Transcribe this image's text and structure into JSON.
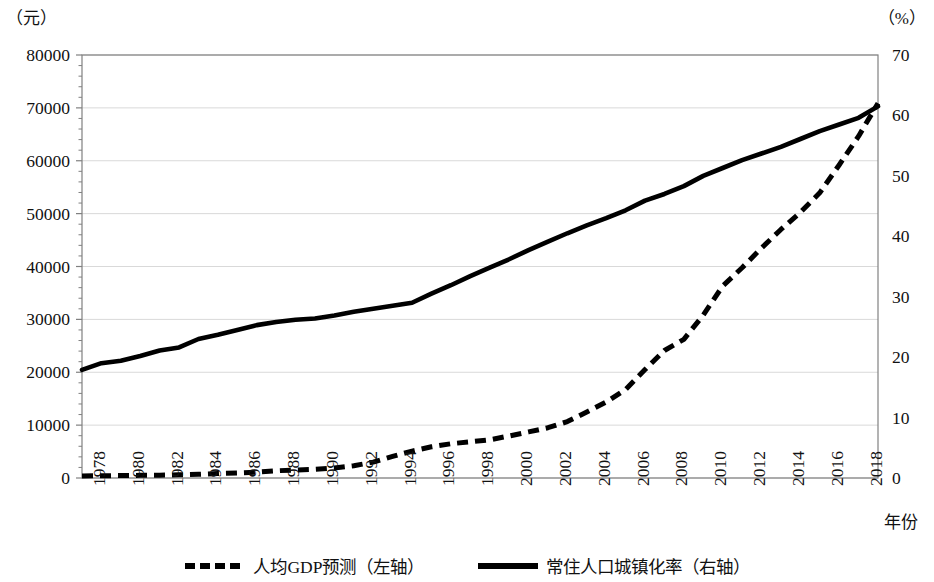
{
  "axes": {
    "left_unit": "（元）",
    "right_unit": "（%）",
    "x_title": "年份",
    "y_left_ticks": [
      "0",
      "10000",
      "20000",
      "30000",
      "40000",
      "50000",
      "60000",
      "70000",
      "80000"
    ],
    "y_right_ticks": [
      "0",
      "10",
      "20",
      "30",
      "40",
      "50",
      "60",
      "70"
    ],
    "x_ticks": [
      "1978",
      "1980",
      "1982",
      "1984",
      "1986",
      "1988",
      "1990",
      "1992",
      "1994",
      "1996",
      "1998",
      "2000",
      "2002",
      "2004",
      "2006",
      "2008",
      "2010",
      "2012",
      "2014",
      "2016",
      "2018"
    ]
  },
  "legend": {
    "items": [
      {
        "label": "人均GDP预测（左轴）",
        "style": "dashed"
      },
      {
        "label": "常住人口城镇化率（右轴）",
        "style": "solid"
      }
    ]
  },
  "colors": {
    "line": "#000000",
    "gridline": "#d9d9d9",
    "frame": "#808080",
    "background": "#ffffff"
  },
  "chart_data": {
    "type": "line",
    "title": "",
    "xlabel": "年份",
    "ylabel": "（元）",
    "y2label": "（%）",
    "grid": true,
    "legend_position": "bottom",
    "xlim": [
      1978,
      2019
    ],
    "ylim": [
      0,
      80000
    ],
    "y2lim": [
      0,
      70
    ],
    "x": [
      1978,
      1979,
      1980,
      1981,
      1982,
      1983,
      1984,
      1985,
      1986,
      1987,
      1988,
      1989,
      1990,
      1991,
      1992,
      1993,
      1994,
      1995,
      1996,
      1997,
      1998,
      1999,
      2000,
      2001,
      2002,
      2003,
      2004,
      2005,
      2006,
      2007,
      2008,
      2009,
      2010,
      2011,
      2012,
      2013,
      2014,
      2015,
      2016,
      2017,
      2018,
      2019
    ],
    "series": [
      {
        "name": "人均GDP预测（左轴）",
        "axis": "left",
        "style": "dashed",
        "unit": "元",
        "values": [
          385,
          423,
          468,
          497,
          533,
          593,
          695,
          858,
          963,
          1112,
          1366,
          1519,
          1644,
          1893,
          2311,
          3007,
          4081,
          5091,
          5898,
          6481,
          6835,
          7225,
          7942,
          8717,
          9506,
          10666,
          12487,
          14368,
          16738,
          20505,
          24121,
          26222,
          30808,
          36302,
          39771,
          43497,
          47005,
          50237,
          53935,
          59201,
          64644,
          70892
        ]
      },
      {
        "name": "常住人口城镇化率（右轴）",
        "axis": "right",
        "style": "solid",
        "unit": "%",
        "values": [
          17.9,
          19.0,
          19.4,
          20.2,
          21.1,
          21.6,
          23.0,
          23.7,
          24.5,
          25.3,
          25.8,
          26.2,
          26.4,
          26.9,
          27.5,
          28.0,
          28.5,
          29.0,
          30.5,
          31.9,
          33.4,
          34.8,
          36.2,
          37.7,
          39.1,
          40.5,
          41.8,
          43.0,
          44.3,
          45.9,
          47.0,
          48.3,
          50.0,
          51.3,
          52.6,
          53.7,
          54.8,
          56.1,
          57.4,
          58.5,
          59.6,
          61.5
        ]
      }
    ]
  }
}
